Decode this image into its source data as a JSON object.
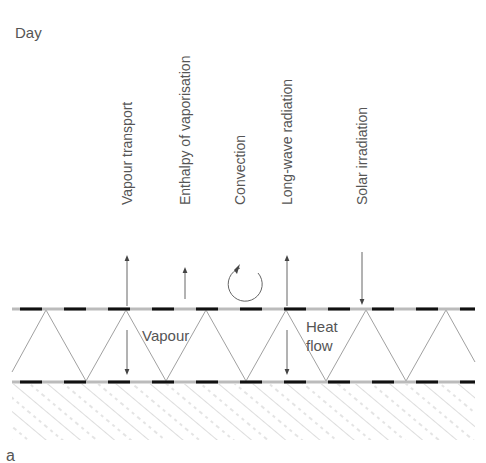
{
  "figure": {
    "title": "Day",
    "panel_label": "a"
  },
  "labels": {
    "vapour_transport": "Vapour transport",
    "enthalpy": "Enthalpy of vaporisation",
    "convection": "Convection",
    "longwave": "Long-wave radiation",
    "solar": "Solar irradiation",
    "vapour_inner": "Vapour",
    "heat_line1": "Heat",
    "heat_line2": "flow"
  },
  "colors": {
    "text": "#555555",
    "line": "#777777",
    "membrane_dash": "#111111",
    "hatch": "#aaaaaa"
  }
}
